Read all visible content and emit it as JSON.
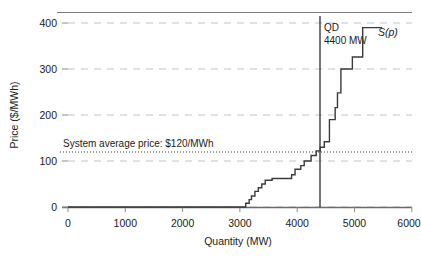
{
  "chart_data": {
    "type": "line",
    "title": "",
    "xlabel": "Quantity (MW)",
    "ylabel": "Price ($/MWh)",
    "xlim": [
      0,
      6000
    ],
    "ylim": [
      0,
      400
    ],
    "grid": true,
    "legend_position": "inline-labels",
    "xticks": [
      0,
      1000,
      2000,
      3000,
      4000,
      5000,
      6000
    ],
    "xtick_labels": [
      "0",
      "1000",
      "2000",
      "3000",
      "4000",
      "5000",
      "6000"
    ],
    "yticks": [
      0,
      100,
      200,
      300,
      400
    ],
    "ytick_labels": [
      "0",
      "100",
      "200",
      "300",
      "400"
    ],
    "series": [
      {
        "name": "S(p)",
        "style": "step-post",
        "points": [
          [
            0,
            0
          ],
          [
            3100,
            0
          ],
          [
            3100,
            8
          ],
          [
            3160,
            8
          ],
          [
            3160,
            16
          ],
          [
            3200,
            16
          ],
          [
            3200,
            24
          ],
          [
            3260,
            24
          ],
          [
            3260,
            34
          ],
          [
            3320,
            34
          ],
          [
            3320,
            42
          ],
          [
            3380,
            42
          ],
          [
            3380,
            50
          ],
          [
            3440,
            50
          ],
          [
            3440,
            58
          ],
          [
            3560,
            58
          ],
          [
            3560,
            62
          ],
          [
            3900,
            62
          ],
          [
            3900,
            70
          ],
          [
            3960,
            70
          ],
          [
            3960,
            82
          ],
          [
            4060,
            82
          ],
          [
            4060,
            90
          ],
          [
            4120,
            90
          ],
          [
            4120,
            100
          ],
          [
            4240,
            100
          ],
          [
            4240,
            112
          ],
          [
            4330,
            112
          ],
          [
            4330,
            122
          ],
          [
            4400,
            122
          ],
          [
            4400,
            130
          ],
          [
            4470,
            130
          ],
          [
            4470,
            142
          ],
          [
            4560,
            142
          ],
          [
            4560,
            190
          ],
          [
            4660,
            190
          ],
          [
            4660,
            216
          ],
          [
            4700,
            216
          ],
          [
            4700,
            248
          ],
          [
            4760,
            248
          ],
          [
            4760,
            300
          ],
          [
            4960,
            300
          ],
          [
            4960,
            326
          ],
          [
            5140,
            326
          ],
          [
            5140,
            390
          ],
          [
            5480,
            390
          ]
        ]
      }
    ],
    "annotations": [
      {
        "name": "demand-line",
        "type": "vline",
        "x": 4400,
        "label_line1": "QD",
        "label_line2": "4400 MW"
      },
      {
        "name": "system-average-price-line",
        "type": "hline",
        "y": 120,
        "style": "dotted",
        "label": "System average price: $120/MWh"
      },
      {
        "name": "supply-curve-label",
        "type": "text",
        "text": "S(p)",
        "x": 5560,
        "y": 375
      }
    ]
  },
  "colors": {
    "curve": "#3a3a3a",
    "axis": "#555555",
    "grid": "#b9c6d4",
    "demand_line": "#2b2b2b",
    "average_line": "#3a3a3a",
    "text": "#1a1a1a",
    "background": "#ffffff"
  }
}
